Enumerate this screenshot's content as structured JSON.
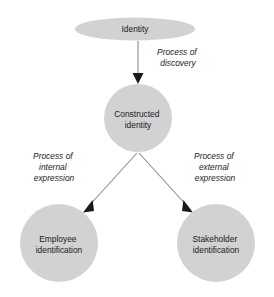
{
  "diagram": {
    "colors": {
      "node_fill": "#d2d2d2",
      "edge_line": "#8c8c8c",
      "arrow_head": "#1a1a1a",
      "text": "#1a1a1a",
      "background": "#ffffff"
    },
    "nodes": [
      {
        "id": "identity",
        "shape": "ellipse",
        "label": "Identity",
        "lines": [
          "Identity"
        ],
        "cx": 135,
        "cy": 29,
        "rx": 60,
        "ry": 11.5
      },
      {
        "id": "constructed-identity",
        "shape": "circle",
        "label": "Constructed identity",
        "lines": [
          "Constructed",
          "identity"
        ],
        "cx": 138,
        "cy": 118,
        "r": 34
      },
      {
        "id": "employee-identification",
        "shape": "circle",
        "label": "Employee identification",
        "lines": [
          "Employee",
          "identification"
        ],
        "cx": 59,
        "cy": 243,
        "r": 39
      },
      {
        "id": "stakeholder-identification",
        "shape": "circle",
        "label": "Stakeholder identification",
        "lines": [
          "Stakeholder",
          "identification"
        ],
        "cx": 216,
        "cy": 243,
        "r": 39
      }
    ],
    "edges": [
      {
        "id": "discovery",
        "from": "identity",
        "to": "constructed-identity",
        "label": "Process of discovery",
        "lines": [
          "Process of",
          "discovery"
        ],
        "label_x": 178,
        "label_y": 58
      },
      {
        "id": "internal-expression",
        "from": "constructed-identity",
        "to": "employee-identification",
        "label": "Process of internal expression",
        "lines": [
          "Process of",
          "internal",
          "expression"
        ],
        "label_x": 54,
        "label_y": 168
      },
      {
        "id": "external-expression",
        "from": "constructed-identity",
        "to": "stakeholder-identification",
        "label": "Process of external expression",
        "lines": [
          "Process of",
          "external",
          "expression"
        ],
        "label_x": 215,
        "label_y": 168
      }
    ]
  }
}
